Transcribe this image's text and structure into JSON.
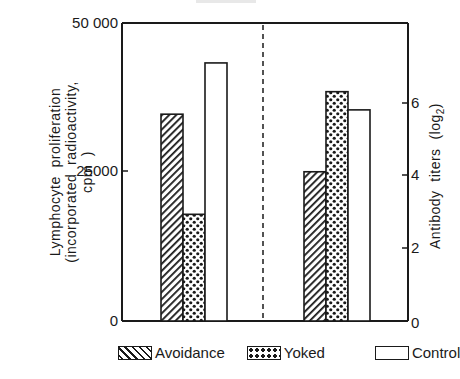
{
  "chart_data": {
    "type": "bar",
    "title": "",
    "panels": [
      {
        "name": "left",
        "ylabel": "Lymphocyte proliferation (incorporated radioactivity, cpm)",
        "ylabel_lines": [
          "Lymphocyte  proliferation",
          "(incorporated  radioactivity,",
          "cpm  )"
        ],
        "ylim": [
          0,
          50000
        ],
        "yticks": [
          0,
          25000,
          50000
        ],
        "ytick_labels": [
          "0",
          "25000",
          "50 000"
        ],
        "series": [
          {
            "name": "Avoidance",
            "value": 34700
          },
          {
            "name": "Yoked",
            "value": 17900
          },
          {
            "name": "Control",
            "value": 43300
          }
        ]
      },
      {
        "name": "right",
        "ylabel": "Antibody titers (log2)",
        "ylabel_main": "Antibody  titers  (log",
        "ylabel_sub": "2",
        "ylabel_close": ")",
        "ylim": [
          0,
          8.2
        ],
        "yticks": [
          0,
          2,
          4,
          6
        ],
        "ytick_labels": [
          "0",
          "2",
          "4",
          "6"
        ],
        "series": [
          {
            "name": "Avoidance",
            "value": 4.1
          },
          {
            "name": "Yoked",
            "value": 6.3
          },
          {
            "name": "Control",
            "value": 5.8
          }
        ]
      }
    ],
    "legend": [
      "Avoidance",
      "Yoked",
      "Control"
    ],
    "legend_position": "bottom",
    "grid": false,
    "separator": "dashed vertical line between panels"
  },
  "legend": {
    "items": [
      {
        "label": "Avoidance",
        "pattern": "diagonal-hatch"
      },
      {
        "label": "Yoked",
        "pattern": "dots"
      },
      {
        "label": "Control",
        "pattern": "plain"
      }
    ]
  },
  "colors": {
    "ink": "#1a1a1a",
    "background": "#ffffff"
  }
}
